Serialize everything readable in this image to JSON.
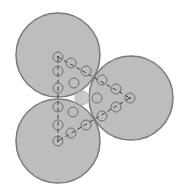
{
  "header": {
    "cut_text": ""
  },
  "colors": {
    "big_circle_fill": "#bdbdbd",
    "big_circle_stroke": "#7a7a7a",
    "small_circle_stroke": "#6e6e6e",
    "dash": "#3a3a3a",
    "center_fill": "#c8c8c8"
  },
  "diagram": {
    "big_circles": [
      {
        "id": "top-left",
        "cx": 58,
        "cy": 55,
        "r": 42
      },
      {
        "id": "bottom-left",
        "cx": 58,
        "cy": 141,
        "r": 42
      },
      {
        "id": "right",
        "cx": 131,
        "cy": 98,
        "r": 42
      }
    ],
    "triangle_vertices": [
      [
        58,
        57
      ],
      [
        130,
        98
      ],
      [
        58,
        141
      ]
    ],
    "edge_circles": [
      [
        58,
        57
      ],
      [
        58,
        71
      ],
      [
        58,
        88
      ],
      [
        58,
        107
      ],
      [
        58,
        125
      ],
      [
        58,
        141
      ],
      [
        71,
        63
      ],
      [
        86,
        71
      ],
      [
        102,
        80
      ],
      [
        116,
        89
      ],
      [
        130,
        98
      ],
      [
        71,
        133
      ],
      [
        86,
        125
      ],
      [
        102,
        116
      ],
      [
        116,
        107
      ]
    ],
    "interior_circles": [
      [
        74,
        83
      ],
      [
        73,
        112
      ],
      [
        97,
        98
      ]
    ],
    "center_circle": {
      "cx": 82,
      "cy": 98,
      "r": 7
    },
    "small_r": 5
  }
}
